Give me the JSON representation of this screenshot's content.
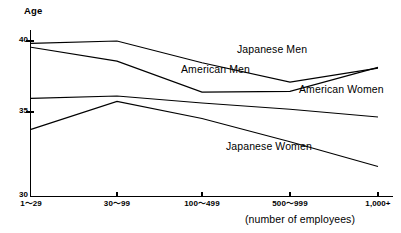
{
  "chart_data": {
    "type": "line",
    "title": "",
    "subtitle": "",
    "ylabel": "Age",
    "xlabel": "(number of employees)",
    "categories": [
      "1～29",
      "30～99",
      "100～499",
      "500～999",
      "1,000+"
    ],
    "x_tick_labels": [
      "1～29",
      "30～99",
      "100～499",
      "500～999",
      "1,000+"
    ],
    "y_tick_labels": [
      "40",
      "35",
      "30"
    ],
    "y_ticks": [
      40,
      35,
      30
    ],
    "ylim": [
      30,
      40.6
    ],
    "grid": false,
    "legend_position": "inline-labels",
    "line_color": "#000000",
    "series": [
      {
        "name": "Japanese Men",
        "label": "Japanese Men",
        "values": [
          39.85,
          40.0,
          38.6,
          37.35,
          38.25
        ]
      },
      {
        "name": "American Men",
        "label": "American Men",
        "values": [
          39.6,
          38.7,
          36.7,
          36.75,
          38.3
        ]
      },
      {
        "name": "American Women",
        "label": "American Women",
        "values": [
          36.3,
          36.45,
          36.0,
          35.6,
          35.1
        ]
      },
      {
        "name": "Japanese Women",
        "label": "Japanese Women",
        "values": [
          34.3,
          36.1,
          35.0,
          33.5,
          31.9
        ]
      }
    ],
    "annotations": [
      {
        "text": "Japanese Men",
        "x_px": 237,
        "y_px": 48
      },
      {
        "text": "American Men",
        "x_px": 181,
        "y_px": 68
      },
      {
        "text": "American Women",
        "x_px": 299,
        "y_px": 88
      },
      {
        "text": "Japanese Women",
        "x_px": 226,
        "y_px": 145
      }
    ]
  }
}
